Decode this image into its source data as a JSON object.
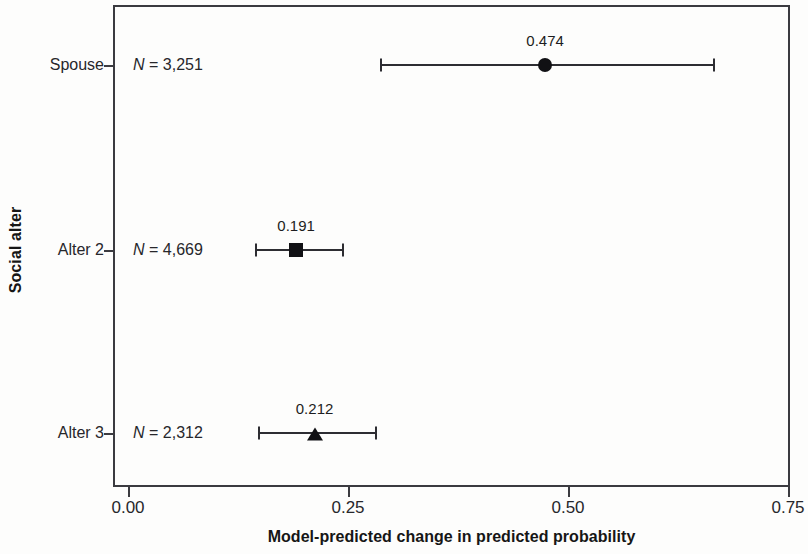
{
  "chart_data": {
    "type": "scatter",
    "title": "",
    "xlabel": "Model-predicted change in predicted probability",
    "ylabel": "Social alter",
    "xlim": [
      0.0,
      0.75
    ],
    "xticks": [
      "0.00",
      "0.25",
      "0.50",
      "0.75"
    ],
    "xtick_values": [
      0.0,
      0.25,
      0.5,
      0.75
    ],
    "categories": [
      "Spouse",
      "Alter 2",
      "Alter 3"
    ],
    "grid": false,
    "legend": "none",
    "points": [
      {
        "category": "Spouse",
        "n_label": "N = 3,251",
        "n": 3251,
        "value": 0.474,
        "value_label": "0.474",
        "ci_low": 0.286,
        "ci_high": 0.665,
        "marker": "circle"
      },
      {
        "category": "Alter 2",
        "n_label": "N = 4,669",
        "n": 4669,
        "value": 0.191,
        "value_label": "0.191",
        "ci_low": 0.144,
        "ci_high": 0.243,
        "marker": "square"
      },
      {
        "category": "Alter 3",
        "n_label": "N = 2,312",
        "n": 2312,
        "value": 0.212,
        "value_label": "0.212",
        "ci_low": 0.148,
        "ci_high": 0.281,
        "marker": "triangle"
      }
    ]
  },
  "colors": {
    "axis": "#3b3b40",
    "marker": "#111114",
    "text": "#27272b",
    "background": "#fdfdfc"
  }
}
